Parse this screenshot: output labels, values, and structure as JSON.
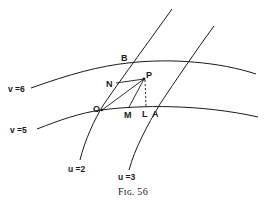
{
  "figure": {
    "caption": "Fig. 56",
    "caption_display": "Fɪɢ. 56"
  },
  "curves": {
    "u2": {
      "label": "u =2"
    },
    "u3": {
      "label": "u =3"
    },
    "v6": {
      "label": "v =6"
    },
    "v5": {
      "label": "v =5"
    }
  },
  "points": {
    "B": "B",
    "N": "N",
    "P": "P",
    "O": "O",
    "M": "M",
    "L": "L",
    "A": "A"
  },
  "colors": {
    "ink": "#1a1a1a",
    "background": "#ffffff"
  }
}
